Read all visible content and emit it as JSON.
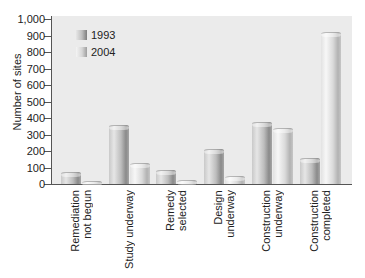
{
  "chart_data": {
    "type": "bar",
    "title": "",
    "xlabel": "",
    "ylabel": "Number of sites",
    "ylim": [
      0,
      1000
    ],
    "yticks": [
      "1,000",
      "900",
      "800",
      "700",
      "600",
      "500",
      "400",
      "300",
      "200",
      "100",
      "0"
    ],
    "grid": false,
    "legend_position": "upper-left (inside plot)",
    "categories": [
      "Remediation not begun",
      "Study underway",
      "Remedy selected",
      "Design underway",
      "Construction underway",
      "Construction completed"
    ],
    "series": [
      {
        "name": "1993",
        "values": [
          75,
          360,
          85,
          210,
          375,
          155
        ]
      },
      {
        "name": "2004",
        "values": [
          20,
          130,
          25,
          50,
          340,
          920
        ]
      }
    ]
  },
  "axis": {
    "ylabel": "Number of sites",
    "ticks": [
      "1,000",
      "900",
      "800",
      "700",
      "600",
      "500",
      "400",
      "300",
      "200",
      "100",
      "0"
    ]
  },
  "legend": {
    "items": [
      {
        "label": "1993"
      },
      {
        "label": "2004"
      }
    ]
  },
  "categories": [
    {
      "label": "Remediation\nnot begun"
    },
    {
      "label": "Study underway"
    },
    {
      "label": "Remedy\nselected"
    },
    {
      "label": "Design\nunderway"
    },
    {
      "label": "Construction\nunderway"
    },
    {
      "label": "Construction\ncompleted"
    }
  ]
}
